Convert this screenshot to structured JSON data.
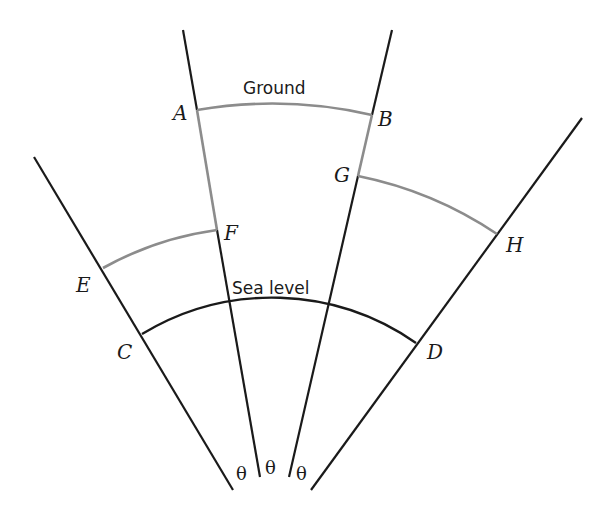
{
  "diagram": {
    "labels": {
      "ground": "Ground",
      "sea_level": "Sea level"
    },
    "points": {
      "A": "A",
      "B": "B",
      "C": "C",
      "D": "D",
      "E": "E",
      "F": "F",
      "G": "G",
      "H": "H"
    },
    "angles": [
      "θ",
      "θ",
      "θ"
    ],
    "colors": {
      "ray": "#1a1a1a",
      "highlight": "#8c8c8c"
    }
  }
}
